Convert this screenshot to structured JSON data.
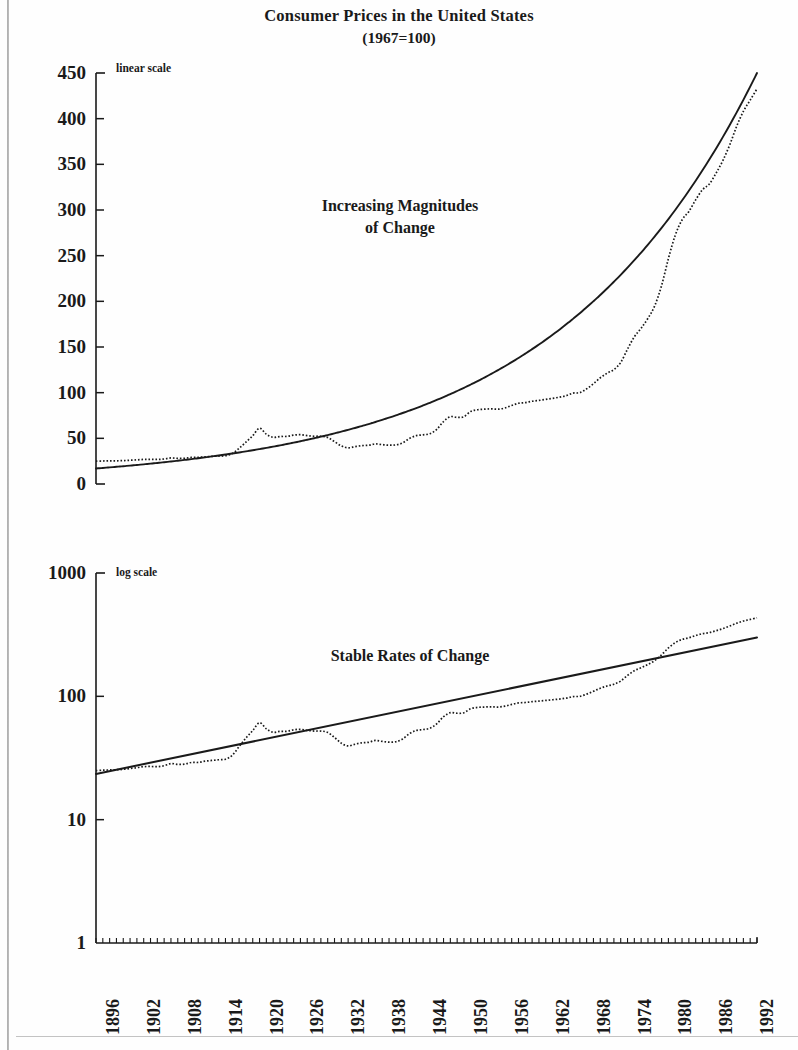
{
  "title": {
    "main": "Consumer Prices in the United States",
    "sub": "(1967=100)"
  },
  "chart_data": [
    {
      "type": "line",
      "title": "Increasing Magnitudes of Change",
      "scale_note": "linear scale",
      "yscale": "linear",
      "ylim": [
        0,
        450
      ],
      "yticks": [
        0,
        50,
        100,
        150,
        200,
        250,
        300,
        350,
        400,
        450
      ],
      "xlabel": "",
      "ylabel": "",
      "xlim": [
        1896,
        1993
      ],
      "xticks": [
        1896,
        1902,
        1908,
        1914,
        1920,
        1926,
        1932,
        1938,
        1944,
        1950,
        1956,
        1962,
        1968,
        1974,
        1980,
        1986,
        1992
      ],
      "grid": false,
      "legend": "none",
      "series": [
        {
          "name": "Consumer Price Index",
          "style": "dotted",
          "x": [
            1896,
            1897,
            1898,
            1899,
            1900,
            1901,
            1902,
            1903,
            1904,
            1905,
            1906,
            1907,
            1908,
            1909,
            1910,
            1911,
            1912,
            1913,
            1914,
            1915,
            1916,
            1917,
            1918,
            1919,
            1920,
            1921,
            1922,
            1923,
            1924,
            1925,
            1926,
            1927,
            1928,
            1929,
            1930,
            1931,
            1932,
            1933,
            1934,
            1935,
            1936,
            1937,
            1938,
            1939,
            1940,
            1941,
            1942,
            1943,
            1944,
            1945,
            1946,
            1947,
            1948,
            1949,
            1950,
            1951,
            1952,
            1953,
            1954,
            1955,
            1956,
            1957,
            1958,
            1959,
            1960,
            1961,
            1962,
            1963,
            1964,
            1965,
            1966,
            1967,
            1968,
            1969,
            1970,
            1971,
            1972,
            1973,
            1974,
            1975,
            1976,
            1977,
            1978,
            1979,
            1980,
            1981,
            1982,
            1983,
            1984,
            1985,
            1986,
            1987,
            1988,
            1989,
            1990,
            1991,
            1992,
            1993
          ],
          "values": [
            25.0,
            25.2,
            25.3,
            25.4,
            25.6,
            26.0,
            26.4,
            26.9,
            27.0,
            26.9,
            27.4,
            28.5,
            28.1,
            28.2,
            29.1,
            29.1,
            29.8,
            30.2,
            30.6,
            30.9,
            33.3,
            39.1,
            45.9,
            52.8,
            61.1,
            54.5,
            51.1,
            52.0,
            52.1,
            53.5,
            54.0,
            53.0,
            52.3,
            52.3,
            51.0,
            46.4,
            41.7,
            39.6,
            40.9,
            42.0,
            42.4,
            43.9,
            43.1,
            42.5,
            42.8,
            45.0,
            49.9,
            52.9,
            53.8,
            55.1,
            59.8,
            68.4,
            73.7,
            72.9,
            73.7,
            79.5,
            81.3,
            81.9,
            82.2,
            81.9,
            83.2,
            86.0,
            88.4,
            89.1,
            90.6,
            91.5,
            92.6,
            93.8,
            95.0,
            96.7,
            99.5,
            100.0,
            104.2,
            109.8,
            116.3,
            121.3,
            125.3,
            133.1,
            147.7,
            161.2,
            170.5,
            181.5,
            195.3,
            217.4,
            246.8,
            272.3,
            289.1,
            298.4,
            311.1,
            322.2,
            328.4,
            340.4,
            354.3,
            371.3,
            391.4,
            408.0,
            420.3,
            432.7
          ]
        },
        {
          "name": "Exponential trend",
          "style": "solid",
          "x": [
            1896,
            1993
          ],
          "values": [
            17.0,
            450.0
          ],
          "description": "smooth exponential growth curve fitted through the series"
        }
      ],
      "annotations": [
        {
          "text": "Increasing Magnitudes",
          "x": 1936,
          "y": 305
        },
        {
          "text": "of Change",
          "x": 1936,
          "y": 273
        }
      ]
    },
    {
      "type": "line",
      "title": "Stable Rates of Change",
      "scale_note": "log scale",
      "yscale": "log",
      "ylim": [
        1,
        1000
      ],
      "yticks": [
        1,
        10,
        100,
        1000
      ],
      "xlabel": "",
      "ylabel": "",
      "xlim": [
        1896,
        1993
      ],
      "xticks": [
        1896,
        1902,
        1908,
        1914,
        1920,
        1926,
        1932,
        1938,
        1944,
        1950,
        1956,
        1962,
        1968,
        1974,
        1980,
        1986,
        1992
      ],
      "grid": false,
      "legend": "none",
      "series": [
        {
          "name": "Consumer Price Index",
          "style": "dotted",
          "x": [
            1896,
            1897,
            1898,
            1899,
            1900,
            1901,
            1902,
            1903,
            1904,
            1905,
            1906,
            1907,
            1908,
            1909,
            1910,
            1911,
            1912,
            1913,
            1914,
            1915,
            1916,
            1917,
            1918,
            1919,
            1920,
            1921,
            1922,
            1923,
            1924,
            1925,
            1926,
            1927,
            1928,
            1929,
            1930,
            1931,
            1932,
            1933,
            1934,
            1935,
            1936,
            1937,
            1938,
            1939,
            1940,
            1941,
            1942,
            1943,
            1944,
            1945,
            1946,
            1947,
            1948,
            1949,
            1950,
            1951,
            1952,
            1953,
            1954,
            1955,
            1956,
            1957,
            1958,
            1959,
            1960,
            1961,
            1962,
            1963,
            1964,
            1965,
            1966,
            1967,
            1968,
            1969,
            1970,
            1971,
            1972,
            1973,
            1974,
            1975,
            1976,
            1977,
            1978,
            1979,
            1980,
            1981,
            1982,
            1983,
            1984,
            1985,
            1986,
            1987,
            1988,
            1989,
            1990,
            1991,
            1992,
            1993
          ],
          "values": [
            25.0,
            25.2,
            25.3,
            25.4,
            25.6,
            26.0,
            26.4,
            26.9,
            27.0,
            26.9,
            27.4,
            28.5,
            28.1,
            28.2,
            29.1,
            29.1,
            29.8,
            30.2,
            30.6,
            30.9,
            33.3,
            39.1,
            45.9,
            52.8,
            61.1,
            54.5,
            51.1,
            52.0,
            52.1,
            53.5,
            54.0,
            53.0,
            52.3,
            52.3,
            51.0,
            46.4,
            41.7,
            39.6,
            40.9,
            42.0,
            42.4,
            43.9,
            43.1,
            42.5,
            42.8,
            45.0,
            49.9,
            52.9,
            53.8,
            55.1,
            59.8,
            68.4,
            73.7,
            72.9,
            73.7,
            79.5,
            81.3,
            81.9,
            82.2,
            81.9,
            83.2,
            86.0,
            88.4,
            89.1,
            90.6,
            91.5,
            92.6,
            93.8,
            95.0,
            96.7,
            99.5,
            100.0,
            104.2,
            109.8,
            116.3,
            121.3,
            125.3,
            133.1,
            147.7,
            161.2,
            170.5,
            181.5,
            195.3,
            217.4,
            246.8,
            272.3,
            289.1,
            298.4,
            311.1,
            322.2,
            328.4,
            340.4,
            354.3,
            371.3,
            391.4,
            408.0,
            420.3,
            432.7
          ]
        },
        {
          "name": "Constant growth rate trend",
          "style": "solid",
          "x": [
            1896,
            1993
          ],
          "values": [
            23.5,
            300.0
          ],
          "description": "straight line on log scale = constant percentage growth"
        }
      ],
      "annotations": [
        {
          "text": "Stable Rates of Change",
          "x": 1945,
          "y": 200
        }
      ]
    }
  ],
  "colors": {
    "ink": "#1a1a1a",
    "axis": "#333333",
    "background": "#fefefe"
  }
}
